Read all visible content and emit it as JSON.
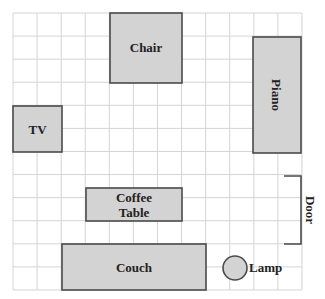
{
  "diagram": {
    "grid": {
      "x0": 13,
      "y0": 13,
      "cols": 12,
      "rows": 12,
      "cell_w": 24.08,
      "cell_h": 23.08,
      "line_color": "#d4d4d4"
    },
    "colors": {
      "furniture_fill": "#d3d3d3",
      "furniture_stroke": "#4a4a4a",
      "label": "#222222"
    },
    "items": [
      {
        "id": "chair",
        "label": "Chair",
        "shape": "rect",
        "x": 110,
        "y": 13,
        "w": 72,
        "h": 70
      },
      {
        "id": "piano",
        "label": "Piano",
        "shape": "rect",
        "x": 253,
        "y": 37,
        "w": 48,
        "h": 116,
        "rotated_label": true
      },
      {
        "id": "tv",
        "label": "TV",
        "shape": "rect",
        "x": 13,
        "y": 106,
        "w": 49,
        "h": 46
      },
      {
        "id": "coffee-table",
        "label": "Coffee Table",
        "label_lines": [
          "Coffee",
          "Table"
        ],
        "shape": "rect",
        "x": 86,
        "y": 188,
        "w": 96,
        "h": 33
      },
      {
        "id": "couch",
        "label": "Couch",
        "shape": "rect",
        "x": 62,
        "y": 244,
        "w": 144,
        "h": 46
      },
      {
        "id": "lamp",
        "label": "Lamp",
        "shape": "circle",
        "cx": 235,
        "cy": 268,
        "r": 12
      }
    ],
    "door": {
      "label": "Door",
      "x": 284,
      "x_wall": 301,
      "y_top": 176,
      "y_bottom": 244
    }
  }
}
